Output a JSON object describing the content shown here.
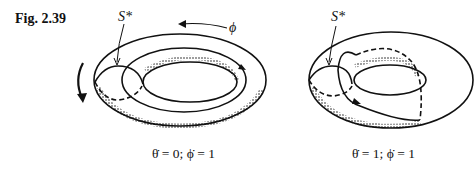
{
  "figure": {
    "label": "Fig. 2.39",
    "panels": [
      {
        "id": "left",
        "section_label": "S*",
        "angle_label": "ϕ",
        "caption": "θ̇ = 0; ϕ̇ = 1"
      },
      {
        "id": "right",
        "section_label": "S*",
        "caption": "θ̇ = 1; ϕ̇ = 1"
      }
    ]
  }
}
